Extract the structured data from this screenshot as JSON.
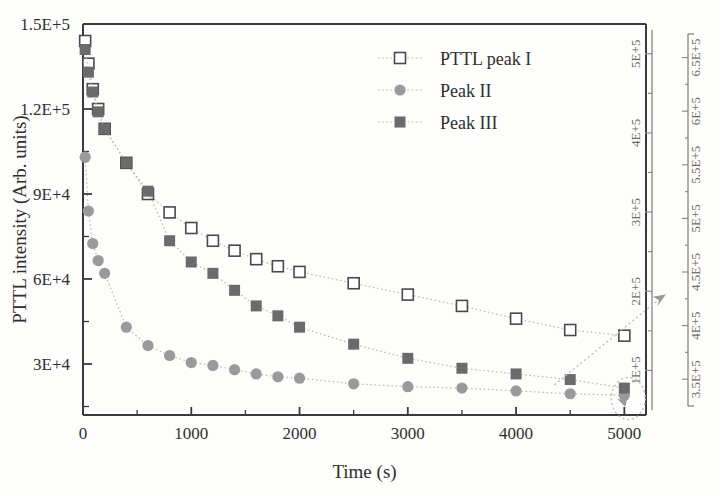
{
  "chart_data": {
    "type": "scatter",
    "title": "",
    "xlabel": "Time (s)",
    "ylabel": "PTTL intensity (Arb. units)",
    "xlim": [
      0,
      5200
    ],
    "ylim": [
      12000,
      150000
    ],
    "grid": false,
    "legend_position": "top-right",
    "xticks": [
      0,
      1000,
      2000,
      3000,
      4000,
      5000
    ],
    "xticklabels": [
      "0",
      "1000",
      "2000",
      "3000",
      "4000",
      "5000"
    ],
    "yticks": [
      30000,
      60000,
      90000,
      120000,
      150000
    ],
    "yticklabels": [
      "3E+4",
      "6E+4",
      "9E+4",
      "1.2E+5",
      "1.5E+5"
    ],
    "right_axis_inner": {
      "ticks": [
        100000,
        200000,
        300000,
        400000,
        500000
      ],
      "ticklabels": [
        "1E+5",
        "2E+5",
        "3E+5",
        "4E+5",
        "5E+5"
      ]
    },
    "right_axis_outer": {
      "ticks": [
        350000,
        400000,
        450000,
        500000,
        550000,
        600000,
        650000
      ],
      "ticklabels": [
        "3.5E+5",
        "4E+5",
        "4.5E+5",
        "5E+5",
        "5.5E+5",
        "6E+5",
        "6.5E+5"
      ]
    },
    "series": [
      {
        "name": "PTTL peak I",
        "marker": "open-square",
        "color": "#4a4a4a",
        "x": [
          20,
          50,
          90,
          140,
          200,
          400,
          600,
          800,
          1000,
          1200,
          1400,
          1600,
          1800,
          2000,
          2500,
          3000,
          3500,
          4000,
          4500,
          5000
        ],
        "y": [
          144000,
          136000,
          127000,
          120000,
          113000,
          101000,
          90000,
          83500,
          78000,
          73500,
          70000,
          67000,
          64500,
          62500,
          58500,
          54500,
          50500,
          46000,
          42000,
          40000
        ]
      },
      {
        "name": "Peak II",
        "marker": "filled-circle",
        "color": "#9a9a9a",
        "x": [
          20,
          50,
          90,
          140,
          200,
          400,
          600,
          800,
          1000,
          1200,
          1400,
          1600,
          1800,
          2000,
          2500,
          3000,
          3500,
          4000,
          4500,
          5000
        ],
        "y": [
          103000,
          84000,
          72500,
          66500,
          62000,
          43000,
          36500,
          33000,
          30500,
          29500,
          28000,
          26500,
          25500,
          25000,
          23000,
          22000,
          21500,
          20500,
          19500,
          19000
        ]
      },
      {
        "name": "Peak III",
        "marker": "filled-square",
        "color": "#6b6b6b",
        "x": [
          20,
          50,
          90,
          140,
          200,
          400,
          600,
          800,
          1000,
          1200,
          1400,
          1600,
          1800,
          2000,
          2500,
          3000,
          3500,
          4000,
          4500,
          5000
        ],
        "y": [
          141000,
          133000,
          126000,
          119000,
          113000,
          101000,
          91000,
          73500,
          66000,
          62000,
          56000,
          50500,
          47000,
          43000,
          37000,
          32000,
          28500,
          26500,
          24500,
          21500
        ]
      }
    ],
    "annotations": [
      {
        "type": "ellipse",
        "note": "dotted ellipse around final cluster at t=5000"
      },
      {
        "type": "arrow",
        "note": "dotted arrow from final cluster to right-hand axis"
      }
    ]
  },
  "legend": {
    "items": [
      {
        "label": "PTTL peak I",
        "marker": "open-square"
      },
      {
        "label": "Peak II",
        "marker": "filled-circle"
      },
      {
        "label": "Peak III",
        "marker": "filled-square"
      }
    ]
  },
  "axis_titles": {
    "x": "Time (s)",
    "y": "PTTL intensity (Arb. units)"
  }
}
